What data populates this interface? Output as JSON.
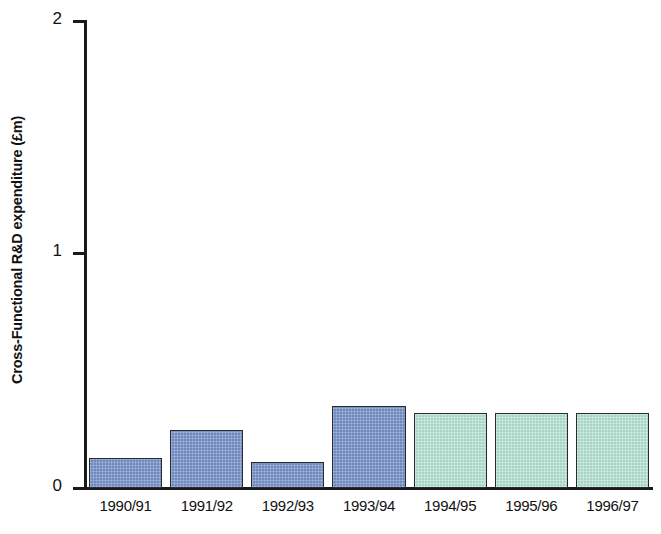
{
  "chart_data": {
    "type": "bar",
    "title": "",
    "subtitle": "",
    "xlabel": "",
    "ylabel": "Cross-Functional R&D expenditure (£m)",
    "categories": [
      "1990/91",
      "1991/92",
      "1992/93",
      "1993/94",
      "1994/95",
      "1995/96",
      "1996/97"
    ],
    "values": [
      0.13,
      0.25,
      0.11,
      0.35,
      0.32,
      0.32,
      0.32
    ],
    "ylim": [
      0,
      2
    ],
    "ytick_labels": [
      "0",
      "1",
      "2"
    ],
    "ytick_values": [
      0,
      1,
      2
    ],
    "grid": false,
    "legend": "none",
    "bar_colors": [
      "#6f8abf",
      "#6f8abf",
      "#6f8abf",
      "#6f8abf",
      "#a6d5c4",
      "#a6d5c4",
      "#a6d5c4"
    ],
    "series": [
      {
        "name": "Cross-Functional R&D expenditure",
        "values": [
          0.13,
          0.25,
          0.11,
          0.35,
          0.32,
          0.32,
          0.32
        ]
      }
    ]
  },
  "colors": {
    "blue_fill": "#6f8abf",
    "green_fill": "#a6d5c4",
    "bar_outline": "#2a2a33",
    "axis": "#1a1a1a",
    "background": "#ffffff",
    "text": "#111111"
  }
}
